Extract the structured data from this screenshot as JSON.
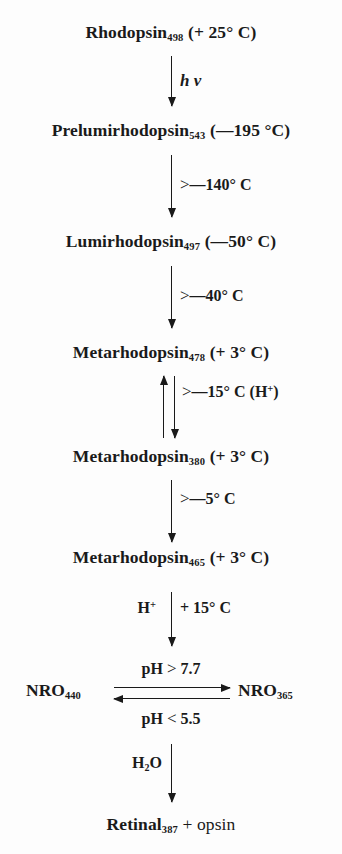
{
  "diagram": {
    "background_color": "#fdfdfd",
    "ink_color": "#1a1a1a"
  },
  "species": [
    {
      "id": "rhodopsin",
      "name": "Rhodopsin",
      "subscript": "498",
      "condition": "(+ 25° C)"
    },
    {
      "id": "prelumirhodopsin",
      "name": "Prelumirhodopsin",
      "subscript": "543",
      "condition": "(—195 °C)"
    },
    {
      "id": "lumirhodopsin",
      "name": "Lumirhodopsin",
      "subscript": "497",
      "condition": "(—50° C)"
    },
    {
      "id": "metarhodopsin-478",
      "name": "Metarhodopsin",
      "subscript": "478",
      "condition": "(+ 3° C)"
    },
    {
      "id": "metarhodopsin-380",
      "name": "Metarhodopsin",
      "subscript": "380",
      "condition": "(+ 3° C)"
    },
    {
      "id": "metarhodopsin-465",
      "name": "Metarhodopsin",
      "subscript": "465",
      "condition": "(+ 3° C)"
    },
    {
      "id": "retinal",
      "name": "Retinal",
      "subscript": "387",
      "condition": "+ opsin"
    }
  ],
  "equilibrium": {
    "left_name": "NRO",
    "left_subscript": "440",
    "right_name": "NRO",
    "right_subscript": "365",
    "forward_label_prefix": "pH ",
    "forward_label_gt": ">",
    "forward_label_value": " 7.7",
    "reverse_label_prefix": "pH ",
    "reverse_label_gt": "<",
    "reverse_label_value": " 5.5"
  },
  "arrows": [
    {
      "id": "arrow-photon",
      "label": "h v",
      "label_side": "right",
      "direction": "down"
    },
    {
      "id": "arrow-to-lumirhodopsin",
      "gt": ">",
      "label": "—140° C",
      "label_side": "right",
      "direction": "down"
    },
    {
      "id": "arrow-to-metarhodopsin-478",
      "gt": ">",
      "label": "—40° C",
      "label_side": "right",
      "direction": "down"
    },
    {
      "id": "arrow-metarhodopsin-equilibrium",
      "gt": ">",
      "label": "—15° C (H",
      "label_sup": "+",
      "label_tail": ")",
      "label_side": "right",
      "direction": "both"
    },
    {
      "id": "arrow-to-metarhodopsin-465",
      "gt": ">",
      "label": "—5° C",
      "label_side": "right",
      "direction": "down"
    },
    {
      "id": "arrow-to-nro",
      "label_left_text": "H",
      "label_left_sup": "+",
      "label_right": "+ 15° C",
      "direction": "down"
    },
    {
      "id": "arrow-hydrolysis",
      "label_left_text": "H",
      "label_left_sub": "2",
      "label_left_tail": "O",
      "direction": "down"
    }
  ]
}
